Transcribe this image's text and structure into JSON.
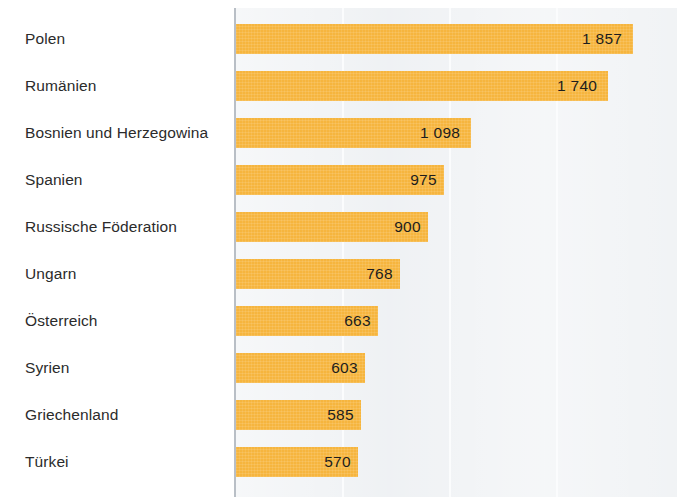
{
  "chart_data": {
    "type": "bar",
    "orientation": "horizontal",
    "title": "",
    "subtitle": "",
    "xlabel": "",
    "ylabel": "",
    "xlim": [
      0,
      2050
    ],
    "gridlines": [
      500,
      1000,
      1500
    ],
    "grid": true,
    "legend": null,
    "categories": [
      "Polen",
      "Rumänien",
      "Bosnien und Herzegowina",
      "Spanien",
      "Russische Föderation",
      "Ungarn",
      "Österreich",
      "Syrien",
      "Griechenland",
      "Türkei"
    ],
    "values": [
      1857,
      1740,
      1098,
      975,
      900,
      768,
      663,
      603,
      585,
      570
    ],
    "value_labels": [
      "1 857",
      "1 740",
      "1 098",
      "975",
      "900",
      "768",
      "663",
      "603",
      "585",
      "570"
    ]
  },
  "colors": {
    "bar": "#f6b53e",
    "plot_background": "#eceff2",
    "page_background": "#ffffff",
    "gridline": "#fbfcfd",
    "axis_spine": "#b9bfc6",
    "label_text": "#2b2b2b",
    "value_text": "#1d1d1d"
  }
}
